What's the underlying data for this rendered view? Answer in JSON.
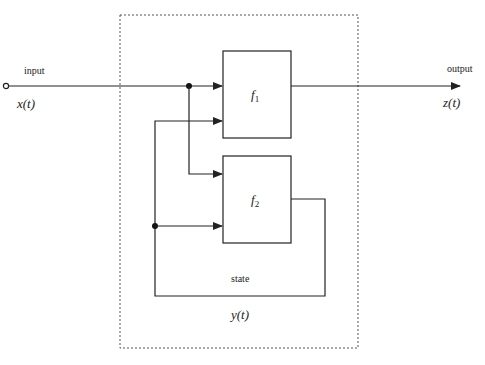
{
  "diagram": {
    "type": "block-diagram",
    "boundary": {
      "style": "dotted"
    },
    "signals": {
      "input_label": "input",
      "input_var": "x(t)",
      "output_label": "output",
      "output_var": "z(t)",
      "state_label": "state",
      "state_var": "y(t)"
    },
    "blocks": [
      {
        "id": "f1",
        "symbol": "f",
        "subscript": "1"
      },
      {
        "id": "f2",
        "symbol": "f",
        "subscript": "2"
      }
    ],
    "edges": [
      {
        "from": "input",
        "to": "f1"
      },
      {
        "from": "input",
        "to": "f2"
      },
      {
        "from": "state",
        "to": "f1"
      },
      {
        "from": "state",
        "to": "f2"
      },
      {
        "from": "f1",
        "to": "output"
      },
      {
        "from": "f2",
        "to": "state"
      }
    ],
    "colors": {
      "line": "#222222",
      "background": "#ffffff"
    }
  }
}
